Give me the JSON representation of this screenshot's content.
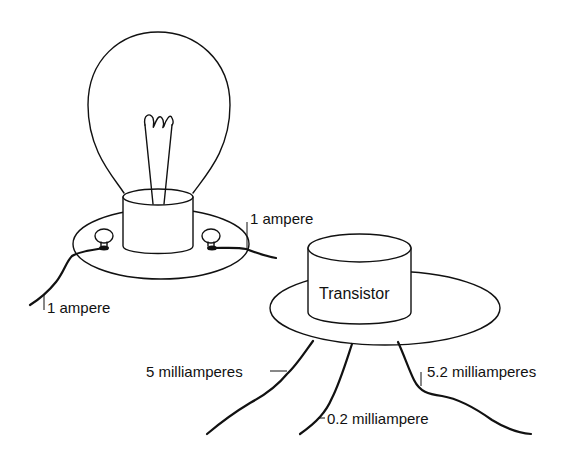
{
  "diagram": {
    "components": [
      {
        "name": "light-bulb",
        "label": ""
      },
      {
        "name": "transistor",
        "label": "Transistor"
      }
    ],
    "labels": {
      "bulb_left_current": "1 ampere",
      "bulb_right_current": "1 ampere",
      "transistor_name": "Transistor",
      "transistor_left_lead": "5 milliamperes",
      "transistor_middle_lead": "0.2 milliampere",
      "transistor_right_lead": "5.2 milliamperes"
    },
    "colors": {
      "ink": "#111111",
      "background": "#ffffff"
    }
  }
}
